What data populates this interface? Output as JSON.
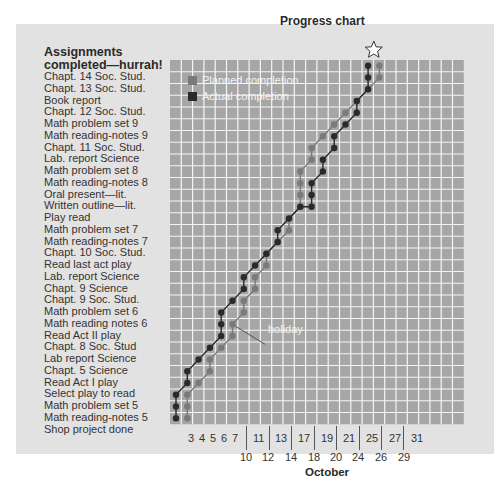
{
  "chart_data": {
    "type": "line",
    "title": "Progress chart",
    "xlabel": "October",
    "ylabel": "Assignments completed—hurrah!",
    "x_ticks_row1": [
      "3",
      "4",
      "5",
      "6",
      "7",
      "11",
      "13",
      "17",
      "19",
      "21",
      "25",
      "27",
      "31"
    ],
    "x_ticks_row2": [
      "10",
      "12",
      "14",
      "18",
      "20",
      "24",
      "26",
      "29"
    ],
    "categories": [
      "Shop project done",
      "Math reading-notes 5",
      "Math problem set 5",
      "Select play to read",
      "Read Act I play",
      "Chapt. 5 Science",
      "Lab report Science",
      "Chapt. 8 Soc. Stud",
      "Read Act II play",
      "Math reading notes 6",
      "Math problem set 6",
      "Chapt. 9 Soc. Stud.",
      "Chapt. 9 Science",
      "Lab. report Science",
      "Read last act play",
      "Chapt. 10 Soc. Stud.",
      "Math reading-notes 7",
      "Math problem set 7",
      "Play read",
      "Written outline—lit.",
      "Oral present—lit.",
      "Math reading-notes 8",
      "Math problem set 8",
      "Lab. report Science",
      "Chapt. 11 Soc. Stud.",
      "Math reading-notes 9",
      "Math problem set 9",
      "Chapt. 12 Soc. Stud.",
      "Book report",
      "Chapt. 13 Soc. Stud.",
      "Chapt. 14 Soc. Stud."
    ],
    "series": [
      {
        "name": "Planned completion",
        "color": "#7a7a7a",
        "points_col_row": [
          [
            1,
            0
          ],
          [
            1,
            1
          ],
          [
            1,
            2
          ],
          [
            2,
            3
          ],
          [
            3,
            4
          ],
          [
            3,
            5
          ],
          [
            4,
            6
          ],
          [
            5,
            7
          ],
          [
            5,
            8
          ],
          [
            6,
            9
          ],
          [
            6,
            10
          ],
          [
            7,
            11
          ],
          [
            7,
            12
          ],
          [
            8,
            13
          ],
          [
            8,
            14
          ],
          [
            9,
            15
          ],
          [
            10,
            16
          ],
          [
            10,
            17
          ],
          [
            11,
            18
          ],
          [
            11,
            19
          ],
          [
            11,
            20
          ],
          [
            11,
            21
          ],
          [
            12,
            22
          ],
          [
            12,
            23
          ],
          [
            13,
            24
          ],
          [
            14,
            25
          ],
          [
            15,
            26
          ],
          [
            16,
            27
          ],
          [
            17,
            28
          ],
          [
            18,
            29
          ],
          [
            18,
            30
          ]
        ]
      },
      {
        "name": "Actual completion",
        "color": "#2a2a2a",
        "points_col_row": [
          [
            0,
            0
          ],
          [
            0,
            1
          ],
          [
            0,
            2
          ],
          [
            1,
            3
          ],
          [
            1,
            4
          ],
          [
            2,
            5
          ],
          [
            3,
            6
          ],
          [
            4,
            7
          ],
          [
            4,
            8
          ],
          [
            4,
            9
          ],
          [
            5,
            10
          ],
          [
            6,
            11
          ],
          [
            6,
            12
          ],
          [
            7,
            13
          ],
          [
            8,
            14
          ],
          [
            9,
            15
          ],
          [
            9,
            16
          ],
          [
            10,
            17
          ],
          [
            11,
            18
          ],
          [
            12,
            18
          ],
          [
            12,
            19
          ],
          [
            12,
            20
          ],
          [
            13,
            21
          ],
          [
            13,
            22
          ],
          [
            14,
            23
          ],
          [
            14,
            24
          ],
          [
            15,
            25
          ],
          [
            16,
            26
          ],
          [
            16,
            27
          ],
          [
            17,
            28
          ],
          [
            17,
            29
          ],
          [
            17,
            30
          ]
        ]
      }
    ],
    "annotations": [
      {
        "text": "holiday",
        "col": 5,
        "row": 8
      },
      {
        "text": "star",
        "col": 17.5,
        "row": 31
      }
    ],
    "grid": true,
    "legend_position": "upper-left inside plot"
  },
  "header": {
    "title": "Progress chart",
    "tasks_heading": "Assignments completed—hurrah!"
  },
  "legend": {
    "planned": "Planned completion",
    "actual": "Actual completion"
  },
  "xaxis": {
    "month": "October",
    "holiday_label": "holiday"
  },
  "tasks_top_down": [
    "Chapt. 14 Soc. Stud.",
    "Chapt. 13 Soc. Stud.",
    "Book report",
    "Chapt. 12 Soc. Stud.",
    "Math problem set 9",
    "Math reading-notes 9",
    "Chapt. 11 Soc. Stud.",
    "Lab. report Science",
    "Math problem set 8",
    "Math reading-notes 8",
    "Oral present—lit.",
    "Written outline—lit.",
    "Play read",
    "Math problem set 7",
    "Math reading-notes 7",
    "Chapt. 10 Soc. Stud.",
    "Read last act play",
    "Lab. report Science",
    "Chapt. 9 Science",
    "Chapt. 9 Soc. Stud.",
    "Math problem set 6",
    "Math reading notes 6",
    "Read Act II play",
    "Chapt. 8 Soc. Stud",
    "Lab report Science",
    "Chapt. 5 Science",
    "Read Act I play",
    "Select play to read",
    "Math problem set 5",
    "Math reading-notes 5",
    "Shop project done"
  ],
  "colors": {
    "panel": "#e2e2e2",
    "plot": "#a6a6a6",
    "gridline": "#f5f5f5",
    "planned": "#7a7a7a",
    "actual": "#2a2a2a"
  }
}
